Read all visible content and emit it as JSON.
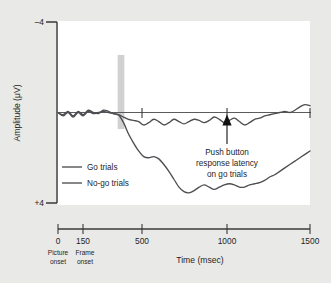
{
  "figure": {
    "background_color": "#e9e9e7",
    "plot_background_color": "#ffffff",
    "trace_color": "#4d4d52",
    "highlight_color": "#c9c9c9"
  },
  "axes": {
    "y_title": "Amplitude (μV)",
    "y_top_label": "–4",
    "y_bottom_label": "+4",
    "x_title": "Time (msec)",
    "x_tick_labels": [
      "0",
      "150",
      "500",
      "1000",
      "1500"
    ],
    "x_sub_labels": [
      {
        "line1": "Picture",
        "line2": "onset"
      },
      {
        "line1": "Frame",
        "line2": "onset"
      }
    ]
  },
  "legend": {
    "items": [
      {
        "label": "Go trials"
      },
      {
        "label": "No-go trials"
      }
    ]
  },
  "annotation": {
    "line1": "Push button",
    "line2": "response latency",
    "line3": "on go trials",
    "at_time_msec": 1000
  },
  "chart_data": {
    "type": "line",
    "title": "",
    "xlabel": "Time (msec)",
    "ylabel": "Amplitude (μV)",
    "xlim": [
      0,
      1500
    ],
    "ylim": [
      4,
      -4
    ],
    "y_axis_inverted": true,
    "grid": false,
    "legend_position": "lower-left-inside",
    "x_ticks": [
      0,
      150,
      500,
      1000,
      1500
    ],
    "y_ticks": [
      -4,
      4
    ],
    "highlight_band": {
      "x_start": 355,
      "x_end": 395,
      "label": ""
    },
    "annotations": [
      {
        "text": "Push button response latency on go trials",
        "x": 1000,
        "y": 0,
        "arrow": "up"
      }
    ],
    "series": [
      {
        "name": "Go trials",
        "x": [
          0,
          30,
          60,
          90,
          120,
          150,
          180,
          210,
          240,
          270,
          300,
          330,
          360,
          390,
          420,
          450,
          480,
          510,
          540,
          570,
          600,
          630,
          660,
          690,
          720,
          750,
          780,
          810,
          840,
          870,
          900,
          930,
          960,
          990,
          1020,
          1050,
          1080,
          1110,
          1140,
          1170,
          1200,
          1230,
          1260,
          1290,
          1320,
          1350,
          1380,
          1410,
          1440,
          1470,
          1500
        ],
        "y": [
          0.0,
          -0.1,
          0.05,
          -0.15,
          0.05,
          -0.1,
          0.1,
          0.0,
          -0.05,
          0.1,
          0.05,
          -0.05,
          -0.1,
          -0.45,
          -0.95,
          -1.35,
          -1.7,
          -1.95,
          -2.0,
          -1.95,
          -2.05,
          -2.3,
          -2.6,
          -2.95,
          -3.3,
          -3.5,
          -3.55,
          -3.45,
          -3.3,
          -3.2,
          -3.3,
          -3.4,
          -3.3,
          -3.2,
          -3.15,
          -3.2,
          -3.3,
          -3.3,
          -3.2,
          -3.15,
          -3.1,
          -3.0,
          -2.85,
          -2.75,
          -2.6,
          -2.45,
          -2.3,
          -2.15,
          -2.0,
          -1.85,
          -1.7
        ]
      },
      {
        "name": "No-go trials",
        "x": [
          0,
          30,
          60,
          90,
          120,
          150,
          180,
          210,
          240,
          270,
          300,
          330,
          360,
          390,
          420,
          450,
          480,
          510,
          540,
          570,
          600,
          630,
          660,
          690,
          720,
          750,
          780,
          810,
          840,
          870,
          900,
          930,
          960,
          990,
          1020,
          1050,
          1080,
          1110,
          1140,
          1170,
          1200,
          1230,
          1260,
          1290,
          1320,
          1350,
          1380,
          1410,
          1440,
          1470,
          1500
        ],
        "y": [
          0.0,
          -0.15,
          0.0,
          -0.2,
          0.0,
          -0.15,
          0.05,
          -0.05,
          0.0,
          0.05,
          0.0,
          -0.05,
          -0.1,
          -0.2,
          -0.3,
          -0.35,
          -0.4,
          -0.55,
          -0.45,
          -0.3,
          -0.4,
          -0.55,
          -0.45,
          -0.3,
          -0.4,
          -0.5,
          -0.4,
          -0.3,
          -0.35,
          -0.45,
          -0.35,
          -0.2,
          -0.3,
          -0.45,
          -0.35,
          -0.25,
          -0.4,
          -0.55,
          -0.45,
          -0.3,
          -0.25,
          -0.15,
          -0.1,
          -0.05,
          0.0,
          0.05,
          0.0,
          0.1,
          0.25,
          0.35,
          0.3
        ]
      }
    ]
  }
}
